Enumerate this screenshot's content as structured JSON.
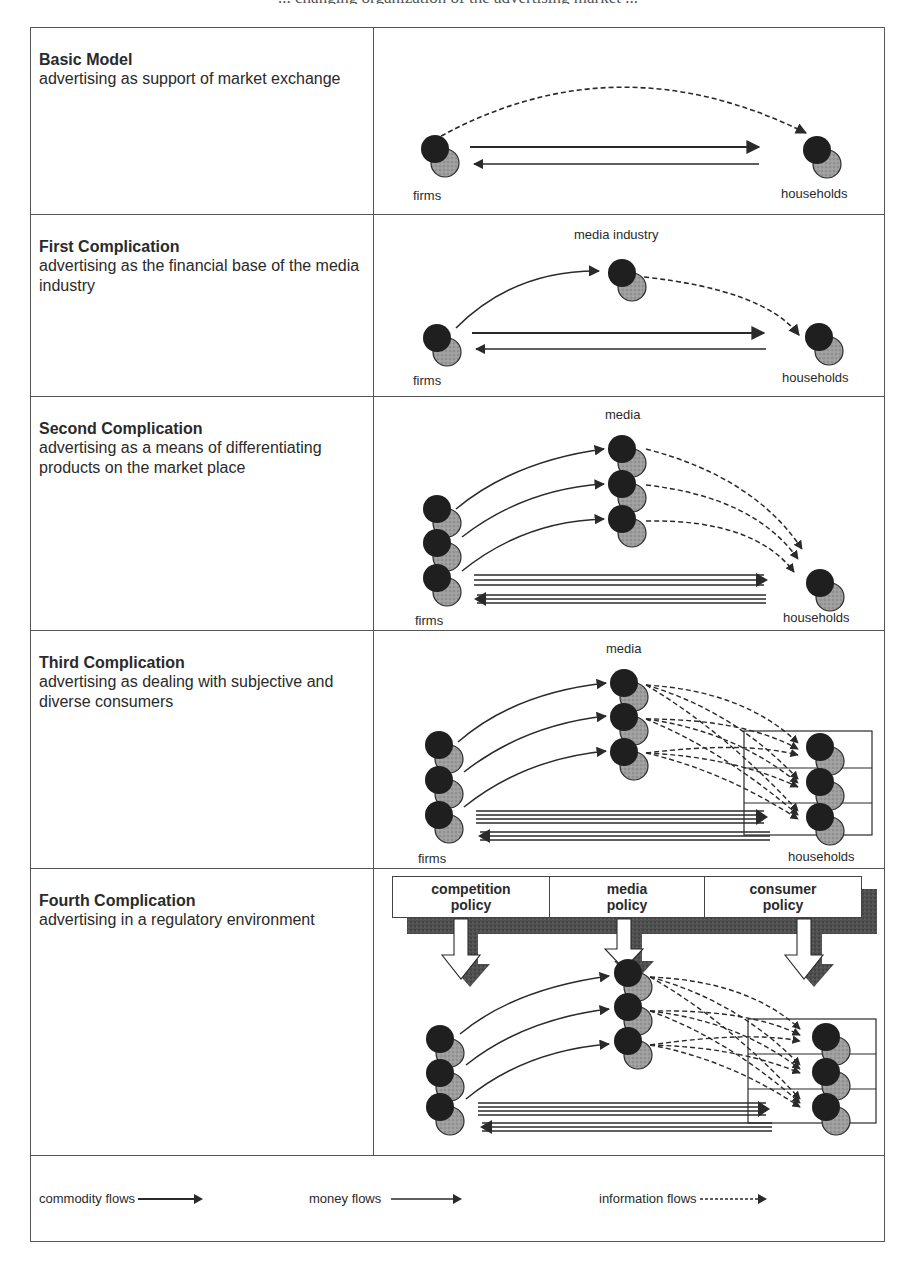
{
  "caption_fragment": "... changing organization of the advertising market ...",
  "rows": [
    {
      "title": "Basic Model",
      "description": "advertising as support of market exchange",
      "labels": {
        "left": "firms",
        "right": "households"
      }
    },
    {
      "title": "First Complication",
      "description": "advertising as the financial base of the media industry",
      "labels": {
        "top": "media industry",
        "left": "firms",
        "right": "households"
      }
    },
    {
      "title": "Second Complication",
      "description": "advertising as a means of differentiating products on the market place",
      "labels": {
        "top": "media",
        "left": "firms",
        "right": "households"
      }
    },
    {
      "title": "Third Complication",
      "description": "advertising as dealing with subjective and diverse consumers",
      "labels": {
        "top": "media",
        "left": "firms",
        "right": "households"
      }
    },
    {
      "title": "Fourth Complication",
      "description": "advertising in a regulatory environment",
      "policies": [
        {
          "line1": "competition",
          "line2": "policy"
        },
        {
          "line1": "media",
          "line2": "policy"
        },
        {
          "line1": "consumer",
          "line2": "policy"
        }
      ]
    }
  ],
  "legend": {
    "commodity": "commodity flows",
    "money": "money flows",
    "information": "information flows"
  },
  "colors": {
    "node_dark": "#1f1f1f",
    "node_light": "#9a9a9a",
    "line": "#2a2a2a",
    "shadow": "#4a4a4a"
  }
}
